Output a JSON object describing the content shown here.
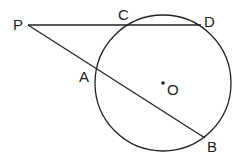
{
  "diagram": {
    "labels": {
      "P": "P",
      "C": "C",
      "D": "D",
      "A": "A",
      "B": "B",
      "O": "O"
    },
    "colors": {
      "stroke": "#222222",
      "background": "#ffffff"
    }
  }
}
